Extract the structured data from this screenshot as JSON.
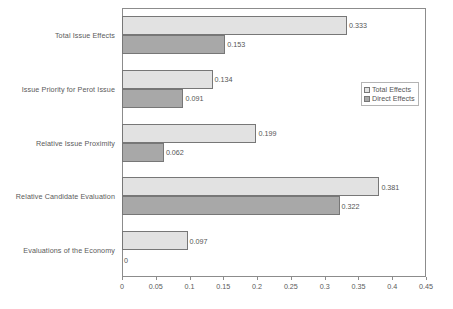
{
  "chart_data": {
    "type": "bar",
    "orientation": "horizontal",
    "title": "",
    "xlabel": "",
    "ylabel": "",
    "xlim": [
      0,
      0.45
    ],
    "xticks": [
      "0",
      "0.05",
      "0.1",
      "0.15",
      "0.2",
      "0.25",
      "0.3",
      "0.35",
      "0.4",
      "0.45"
    ],
    "xtick_values": [
      0,
      0.05,
      0.1,
      0.15,
      0.2,
      0.25,
      0.3,
      0.35,
      0.4,
      0.45
    ],
    "grid": false,
    "legend_position": "upper right (inside plot)",
    "categories": [
      "Total Issue Effects",
      "Issue Priority for Perot Issue",
      "Relative Issue Proximity",
      "Relative Candidate Evaluation",
      "Evaluations of the Economy"
    ],
    "series": [
      {
        "name": "Total Effects",
        "color": "#e2e2e2",
        "values": [
          0.333,
          0.134,
          0.199,
          0.381,
          0.097
        ],
        "labels": [
          "0.333",
          "0.134",
          "0.199",
          "0.381",
          "0.097"
        ]
      },
      {
        "name": "Direct Effects",
        "color": "#a8a8a8",
        "values": [
          0.153,
          0.091,
          0.062,
          0.322,
          0
        ],
        "labels": [
          "0.153",
          "0.091",
          "0.062",
          "0.322",
          "0"
        ]
      }
    ]
  },
  "legend": {
    "items": [
      {
        "label": "Total Effects",
        "swatch": "total"
      },
      {
        "label": "Direct Effects",
        "swatch": "direct"
      }
    ]
  },
  "colors": {
    "total_effects": "#e2e2e2",
    "direct_effects": "#a8a8a8",
    "axis": "#8c8c8c",
    "text": "#555555",
    "background": "#ffffff"
  }
}
